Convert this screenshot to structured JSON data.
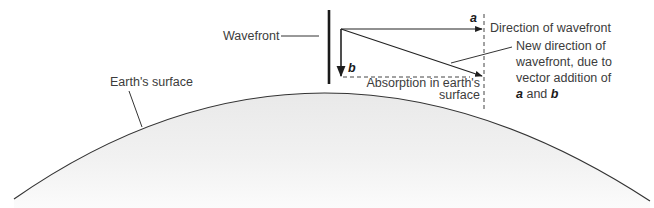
{
  "diagram": {
    "labels": {
      "wavefront": "Wavefront",
      "earth_surface": "Earth's surface",
      "direction": "Direction of wavefront",
      "new_direction_line1": "New direction of",
      "new_direction_line2": "wavefront, due to",
      "new_direction_line3": "vector addition of",
      "new_direction_a": "a",
      "new_direction_and": " and ",
      "new_direction_b": "b",
      "absorption_line1": "Absorption in earth's",
      "absorption_line2": "surface",
      "vector_a": "a",
      "vector_b": "b"
    },
    "colors": {
      "line": "#2a2a2a",
      "earth_fill": "#ececec",
      "text": "#3c3c3c"
    }
  }
}
